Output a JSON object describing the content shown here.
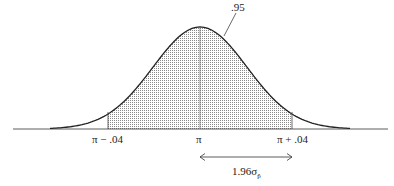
{
  "diagram": {
    "area_label": ".95",
    "tick_labels": {
      "left": "π − .04",
      "center": "π",
      "right": "π + .04"
    },
    "interval_label": "1.96σ",
    "interval_subscript": "p̂",
    "colors": {
      "curve": "#222222",
      "shade": "#9a9a9a",
      "axis": "#333333"
    }
  }
}
